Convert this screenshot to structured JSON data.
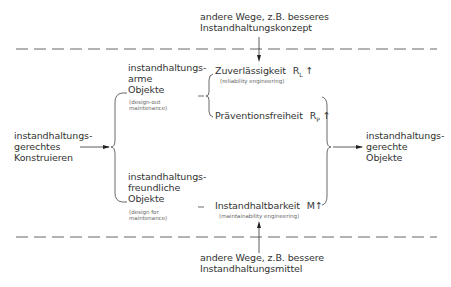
{
  "top_note": {
    "line1": "andere Wege, z.B. besseres",
    "line2": "Instandhaltungskonzept"
  },
  "bottom_note": {
    "line1": "andere Wege, z.B. bessere",
    "line2": "Instandhaltungsmittel"
  },
  "left_input": {
    "line1": "instandhaltungs-",
    "line2": "gerechtes",
    "line3": "Konstruieren"
  },
  "right_output": {
    "line1": "instandhaltungs-",
    "line2": "gerechte",
    "line3": "Objekte"
  },
  "upper_branch": {
    "line1": "instandhaltungs-",
    "line2": "arme",
    "line3": "Objekte",
    "english1": "(design-out",
    "english2": "maintenance)"
  },
  "lower_branch": {
    "line1": "instandhaltungs-",
    "line2": "freundliche",
    "line3": "Objekte",
    "english1": "(design for",
    "english2": "maintenance)"
  },
  "properties": [
    {
      "label": "Zuverlässigkeit",
      "symbol": "R",
      "sub": "L",
      "trend": "↑",
      "english": "(reliability engineering)"
    },
    {
      "label": "Präventionsfreiheit",
      "symbol": "R",
      "sub": "P",
      "trend": "↑",
      "english": ""
    },
    {
      "label": "Instandhaltbarkeit",
      "symbol": "M",
      "sub": "",
      "trend": "↑",
      "english": "(maintainability engineering)"
    }
  ],
  "colors": {
    "line": "#444444",
    "text": "#333333",
    "dash": "#666666"
  }
}
